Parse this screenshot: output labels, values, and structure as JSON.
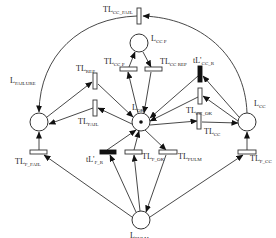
{
  "diagram": {
    "type": "petri-net",
    "places": [
      {
        "id": "L_OK",
        "label": "L",
        "sub": "OK",
        "x": 141,
        "y": 122,
        "token": true
      },
      {
        "id": "L_CC_P",
        "label": "L",
        "sub": "CC P",
        "x": 139,
        "y": 43,
        "token": false
      },
      {
        "id": "L_FAILURE",
        "label": "L",
        "sub": "FAILURE",
        "x": 39,
        "y": 122,
        "token": false
      },
      {
        "id": "L_CC",
        "label": "L",
        "sub": "CC",
        "x": 247,
        "y": 122,
        "token": false
      },
      {
        "id": "L_FULM",
        "label": "L",
        "sub": "FULM",
        "x": 141,
        "y": 220,
        "token": false
      }
    ],
    "transitions": [
      {
        "id": "TL_CC_FAIL",
        "label": "TL",
        "sub": "CC_FAIL",
        "kind": "timed",
        "orient": "v"
      },
      {
        "id": "TL_REP",
        "label": "TL",
        "sub": "REP",
        "kind": "timed",
        "orient": "v"
      },
      {
        "id": "TL_FAIL",
        "label": "TL",
        "sub": "FAIL",
        "kind": "timed",
        "orient": "v"
      },
      {
        "id": "TL_CC_P",
        "label": "TL",
        "sub": "CC P",
        "kind": "timed",
        "orient": "h"
      },
      {
        "id": "TL_CC_REP",
        "label": "TL",
        "sub": "CC REP",
        "kind": "timed",
        "orient": "h"
      },
      {
        "id": "tL'_CC_R",
        "label": "tL'",
        "sub": "CC_R",
        "kind": "immediate",
        "orient": "v"
      },
      {
        "id": "TL_CC_OK",
        "label": "TL",
        "sub": "CC_OK",
        "kind": "timed",
        "orient": "v"
      },
      {
        "id": "TL_CC",
        "label": "TL",
        "sub": "CC",
        "kind": "timed",
        "orient": "v"
      },
      {
        "id": "TL_F_FAIL",
        "label": "TL",
        "sub": "F_FAIL",
        "kind": "timed",
        "orient": "h"
      },
      {
        "id": "tL'_F_R",
        "label": "tL'",
        "sub": "F_R",
        "kind": "immediate",
        "orient": "h"
      },
      {
        "id": "TL_F_OK",
        "label": "TL",
        "sub": "F_OK",
        "kind": "timed",
        "orient": "h"
      },
      {
        "id": "TL_FULM",
        "label": "TL",
        "sub": "FULM",
        "kind": "timed",
        "orient": "h"
      },
      {
        "id": "TL_F_CC",
        "label": "TL",
        "sub": "F_CC",
        "kind": "timed",
        "orient": "h"
      }
    ],
    "arcs": [
      [
        "L_CC",
        "TL_CC_FAIL"
      ],
      [
        "TL_CC_FAIL",
        "L_FAILURE"
      ],
      [
        "L_FAILURE",
        "TL_REP"
      ],
      [
        "TL_REP",
        "L_OK"
      ],
      [
        "L_OK",
        "TL_FAIL"
      ],
      [
        "TL_FAIL",
        "L_FAILURE"
      ],
      [
        "L_OK",
        "TL_CC_P"
      ],
      [
        "TL_CC_P",
        "L_CC_P"
      ],
      [
        "L_CC_P",
        "TL_CC_REP"
      ],
      [
        "TL_CC_REP",
        "L_OK"
      ],
      [
        "L_CC",
        "tL'_CC_R"
      ],
      [
        "tL'_CC_R",
        "L_OK"
      ],
      [
        "L_CC",
        "TL_CC_OK"
      ],
      [
        "TL_CC_OK",
        "L_OK"
      ],
      [
        "L_OK",
        "TL_CC"
      ],
      [
        "TL_CC",
        "L_CC"
      ],
      [
        "L_FULM",
        "TL_F_FAIL"
      ],
      [
        "TL_F_FAIL",
        "L_FAILURE"
      ],
      [
        "L_FULM",
        "tL'_F_R"
      ],
      [
        "tL'_F_R",
        "L_OK"
      ],
      [
        "L_FULM",
        "TL_F_OK"
      ],
      [
        "TL_F_OK",
        "L_OK"
      ],
      [
        "L_OK",
        "TL_FULM"
      ],
      [
        "TL_FULM",
        "L_FULM"
      ],
      [
        "L_FULM",
        "TL_F_CC"
      ],
      [
        "TL_F_CC",
        "L_CC"
      ]
    ]
  },
  "labels": {
    "L_OK": {
      "main": "L",
      "sub": "OK"
    },
    "L_CC_P": {
      "main": "L",
      "sub": "CC P"
    },
    "L_FAILURE": {
      "main": "L",
      "sub": "FAILURE"
    },
    "L_CC": {
      "main": "L",
      "sub": "CC"
    },
    "L_FULM": {
      "main": "L",
      "sub": "FULM"
    },
    "TL_CC_FAIL": {
      "main": "TL",
      "sub": "CC_FAIL"
    },
    "TL_REP": {
      "main": "TL",
      "sub": "REP"
    },
    "TL_FAIL": {
      "main": "TL",
      "sub": "FAIL"
    },
    "TL_CC_P": {
      "main": "TL",
      "sub": "CC P"
    },
    "TL_CC_REP": {
      "main": "TL",
      "sub": "CC REP"
    },
    "tL_CC_R": {
      "main": "tL'",
      "sub": "CC_R"
    },
    "TL_CC_OK": {
      "main": "TL",
      "sub": "CC_OK"
    },
    "TL_CC": {
      "main": "TL",
      "sub": "CC"
    },
    "TL_F_FAIL": {
      "main": "TL",
      "sub": "F_FAIL"
    },
    "tL_F_R": {
      "main": "tL'",
      "sub": "F_R"
    },
    "TL_F_OK": {
      "main": "TL",
      "sub": "F_OK"
    },
    "TL_FULM": {
      "main": "TL",
      "sub": "FULM"
    },
    "TL_F_CC": {
      "main": "TL",
      "sub": "F_CC"
    }
  }
}
